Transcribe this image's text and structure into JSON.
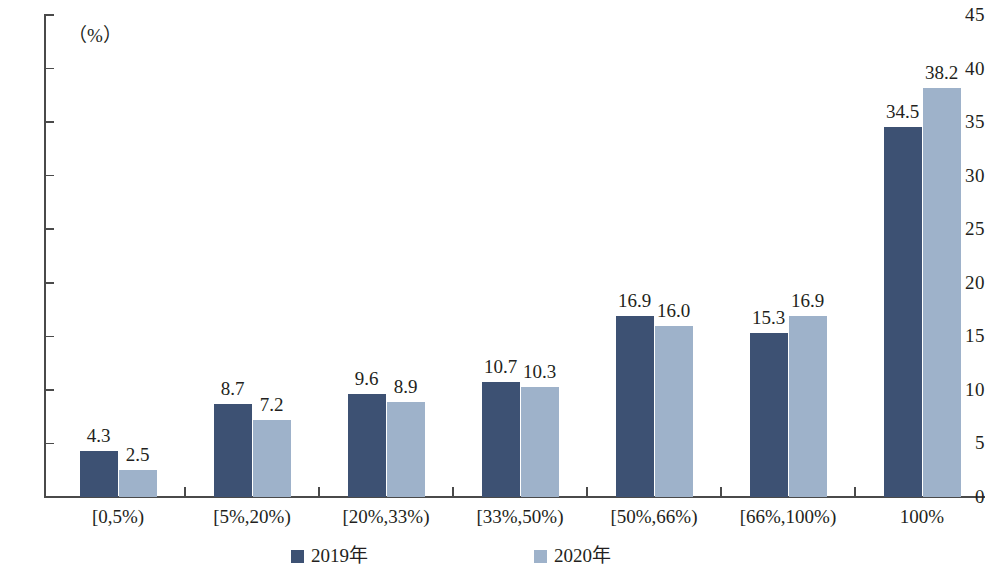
{
  "chart_data": {
    "type": "bar",
    "title": "",
    "subtitle": "",
    "xlabel": "",
    "ylabel": "",
    "unit_label": "（%）",
    "categories": [
      "[0,5%)",
      "[5%,20%)",
      "[20%,33%)",
      "[33%,50%)",
      "[50%,66%)",
      "[66%,100%)",
      "100%"
    ],
    "series": [
      {
        "name": "2019年",
        "color": "#3d5173",
        "values": [
          4.3,
          8.7,
          9.6,
          10.7,
          16.9,
          15.3,
          34.5
        ],
        "labels": [
          "4.3",
          "8.7",
          "9.6",
          "10.7",
          "16.9",
          "15.3",
          "34.5"
        ]
      },
      {
        "name": "2020年",
        "color": "#9eb2ca",
        "values": [
          2.5,
          7.2,
          8.9,
          10.3,
          16.0,
          16.9,
          38.2
        ],
        "labels": [
          "2.5",
          "7.2",
          "8.9",
          "10.3",
          "16.0",
          "16.9",
          "38.2"
        ]
      }
    ],
    "ylim": [
      0,
      45
    ],
    "ytick_values": [
      0,
      5,
      10,
      15,
      20,
      25,
      30,
      35,
      40,
      45
    ],
    "ytick_labels": [
      "0",
      "5",
      "10",
      "15",
      "20",
      "25",
      "30",
      "35",
      "40",
      "45"
    ],
    "grid": false,
    "legend_position": "bottom",
    "legend": [
      "2019年",
      "2020年"
    ]
  },
  "colors": {
    "series_2019": "#3d5173",
    "series_2020": "#9eb2ca",
    "axis": "#4a4a4a",
    "text": "#231f20",
    "background": "#ffffff"
  }
}
